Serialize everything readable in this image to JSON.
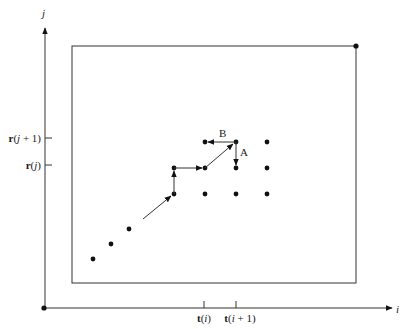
{
  "diagram": {
    "axes": {
      "x_label": "i",
      "y_label": "j",
      "x_ticks": [
        {
          "bold": "t",
          "open": "(",
          "var": "i",
          "rest": ")",
          "x": 204
        },
        {
          "bold": "t",
          "open": "(",
          "var": "i",
          "rest": " + 1)",
          "x": 236
        }
      ],
      "y_ticks": [
        {
          "bold": "r",
          "open": "(",
          "var": "j",
          "rest": " + 1)",
          "y": 138
        },
        {
          "bold": "r",
          "open": "(",
          "var": "j",
          "rest": ")",
          "y": 165
        }
      ]
    },
    "annotations": {
      "A": "A",
      "B": "B"
    },
    "grid_points": [
      [
        205,
        142
      ],
      [
        236,
        142
      ],
      [
        267,
        142
      ],
      [
        174,
        168
      ],
      [
        205,
        168
      ],
      [
        236,
        168
      ],
      [
        267,
        168
      ],
      [
        174,
        194
      ],
      [
        205,
        194
      ],
      [
        236,
        194
      ],
      [
        267,
        194
      ]
    ],
    "diagonal_points": [
      [
        93,
        259
      ],
      [
        111,
        244
      ],
      [
        129,
        229
      ]
    ],
    "corner_points": [
      [
        44,
        308
      ],
      [
        356,
        46
      ]
    ],
    "colors": {
      "line": "#333333",
      "dot": "#111111"
    }
  }
}
